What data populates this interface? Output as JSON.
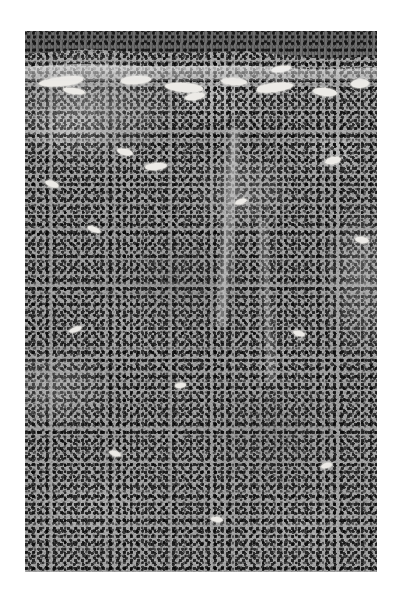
{
  "page": {
    "background_color": "#ffffff",
    "width": 398,
    "height": 597
  },
  "figure": {
    "kind": "histopathology-micrograph",
    "staining": "haematoxylin-and-eosin",
    "rendering": "grayscale",
    "caption": "",
    "plate": {
      "left": 25,
      "top": 31,
      "width": 352,
      "height": 541,
      "base_color": "#9d9d9d",
      "nuclei_color": "#2f2f2f",
      "lumen_color": "#eceae6",
      "epithelium_color": "#6c6c6c"
    },
    "regions": [
      {
        "name": "surface-epithelium",
        "label": "Surface epithelium",
        "description": "Dark basophilic stratified cell band spanning the top margin, sloping downward toward the right"
      },
      {
        "name": "basement-membrane-zone",
        "label": "Subepithelial clear zone",
        "description": "Pale band immediately beneath the epithelium"
      },
      {
        "name": "inflammatory-infiltrate",
        "label": "Dense inflammatory cell infiltrate",
        "description": "Diffuse sheet of small dark nuclei filling the submucosa across the lower four fifths of the field"
      },
      {
        "name": "vascular-lumina",
        "label": "Dilated vascular spaces",
        "description": "Bright elongate empty lumina concentrated in the upper third"
      },
      {
        "name": "fibrous-septum",
        "label": "Pale fibrous septum",
        "description": "Vertical pale band crossing the right-of-centre mid field"
      }
    ],
    "lumina": [
      {
        "name": "lumen-1",
        "left": 14,
        "top": 46,
        "width": 44,
        "height": 9,
        "rotate": -6,
        "radius": "50% 40% 45% 55%"
      },
      {
        "name": "lumen-2",
        "left": 38,
        "top": 57,
        "width": 22,
        "height": 6,
        "rotate": 8,
        "radius": "50%"
      },
      {
        "name": "lumen-3",
        "left": 96,
        "top": 45,
        "width": 30,
        "height": 8,
        "rotate": -4,
        "radius": "45% 55% 50% 50%"
      },
      {
        "name": "lumen-4",
        "left": 140,
        "top": 52,
        "width": 38,
        "height": 9,
        "rotate": 5,
        "radius": "55% 45% 50% 50%"
      },
      {
        "name": "lumen-5",
        "left": 160,
        "top": 62,
        "width": 20,
        "height": 7,
        "rotate": -10,
        "radius": "50%"
      },
      {
        "name": "lumen-6",
        "left": 196,
        "top": 47,
        "width": 26,
        "height": 7,
        "rotate": 3,
        "radius": "50%"
      },
      {
        "name": "lumen-7",
        "left": 232,
        "top": 52,
        "width": 36,
        "height": 9,
        "rotate": -7,
        "radius": "45% 55% 55% 45%"
      },
      {
        "name": "lumen-8",
        "left": 288,
        "top": 57,
        "width": 24,
        "height": 8,
        "rotate": 6,
        "radius": "50%"
      },
      {
        "name": "lumen-9",
        "left": 326,
        "top": 48,
        "width": 18,
        "height": 9,
        "rotate": -3,
        "radius": "50%"
      },
      {
        "name": "lumen-10",
        "left": 246,
        "top": 35,
        "width": 20,
        "height": 6,
        "rotate": -9,
        "radius": "50%"
      },
      {
        "name": "lumen-11",
        "left": 92,
        "top": 118,
        "width": 16,
        "height": 6,
        "rotate": 12,
        "radius": "50%"
      },
      {
        "name": "lumen-12",
        "left": 120,
        "top": 132,
        "width": 22,
        "height": 7,
        "rotate": -5,
        "radius": "50%"
      },
      {
        "name": "lumen-13",
        "left": 20,
        "top": 150,
        "width": 14,
        "height": 6,
        "rotate": 18,
        "radius": "50%"
      },
      {
        "name": "lumen-14",
        "left": 300,
        "top": 126,
        "width": 16,
        "height": 7,
        "rotate": -12,
        "radius": "50%"
      },
      {
        "name": "lumen-15",
        "left": 62,
        "top": 196,
        "width": 14,
        "height": 5,
        "rotate": 22,
        "radius": "50%"
      },
      {
        "name": "lumen-16",
        "left": 210,
        "top": 168,
        "width": 12,
        "height": 5,
        "rotate": -16,
        "radius": "50%"
      },
      {
        "name": "lumen-17",
        "left": 330,
        "top": 206,
        "width": 14,
        "height": 6,
        "rotate": 9,
        "radius": "50%"
      },
      {
        "name": "lumen-18",
        "left": 44,
        "top": 296,
        "width": 13,
        "height": 5,
        "rotate": -20,
        "radius": "50%"
      },
      {
        "name": "lumen-19",
        "left": 268,
        "top": 300,
        "width": 12,
        "height": 5,
        "rotate": 14,
        "radius": "50%"
      },
      {
        "name": "lumen-20",
        "left": 150,
        "top": 352,
        "width": 11,
        "height": 5,
        "rotate": -8,
        "radius": "50%"
      },
      {
        "name": "lumen-21",
        "left": 84,
        "top": 420,
        "width": 12,
        "height": 5,
        "rotate": 16,
        "radius": "50%"
      },
      {
        "name": "lumen-22",
        "left": 296,
        "top": 432,
        "width": 11,
        "height": 5,
        "rotate": -14,
        "radius": "50%"
      },
      {
        "name": "lumen-23",
        "left": 186,
        "top": 486,
        "width": 12,
        "height": 5,
        "rotate": 7,
        "radius": "50%"
      }
    ]
  }
}
